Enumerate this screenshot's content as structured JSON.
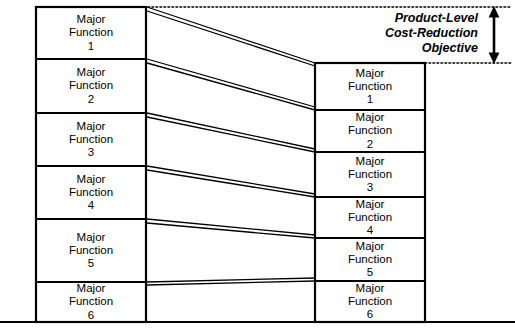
{
  "diagram": {
    "type": "function-cost-reduction-comparison",
    "baseline_label": "",
    "annotation": {
      "text": "Product-Level\nCost-Reduction\nObjective",
      "arrow": "double-headed-vertical-arrow",
      "top_guide": "dotted-line",
      "bottom_guide": "dotted-line"
    },
    "left_column": {
      "name": "current-cost-stack",
      "boxes": [
        {
          "label": "Major\nFunction\n1"
        },
        {
          "label": "Major\nFunction\n2"
        },
        {
          "label": "Major\nFunction\n3"
        },
        {
          "label": "Major\nFunction\n4"
        },
        {
          "label": "Major\nFunction\n5"
        },
        {
          "label": "Major\nFunction\n6"
        }
      ]
    },
    "right_column": {
      "name": "target-cost-stack",
      "boxes": [
        {
          "label": "Major\nFunction\n1"
        },
        {
          "label": "Major\nFunction\n2"
        },
        {
          "label": "Major\nFunction\n3"
        },
        {
          "label": "Major\nFunction\n4"
        },
        {
          "label": "Major\nFunction\n5"
        },
        {
          "label": "Major\nFunction\n6"
        }
      ]
    },
    "colors": {
      "stroke": "#000000",
      "background": "#ffffff",
      "text": "#000000"
    }
  }
}
